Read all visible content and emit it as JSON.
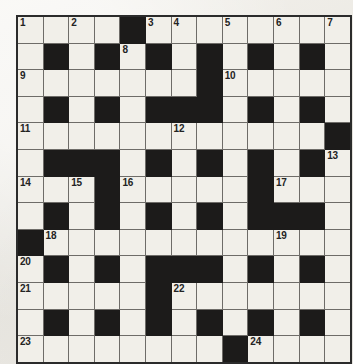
{
  "puzzle": {
    "type": "crossword-grid",
    "title": "Crossword Puzzle Grid",
    "rows": 13,
    "columns": 13,
    "cell_size_px": 24.6,
    "colors": {
      "paper": "#eeece7",
      "cell_fill": "#f1efe9",
      "block_fill": "#1c1b1a",
      "grid_line": "#6e6c68",
      "outer_border": "#2b2b2b",
      "number_text": "#232323"
    },
    "legend": {
      "block": "black / blocked square",
      "open": "white / fillable square"
    },
    "clue_count": 24,
    "clue_numbers_present": [
      1,
      2,
      3,
      4,
      5,
      6,
      7,
      8,
      9,
      10,
      11,
      12,
      13,
      14,
      15,
      16,
      17,
      18,
      19,
      20,
      21,
      22,
      23,
      24
    ],
    "grid": [
      [
        {
          "block": false,
          "number": "1"
        },
        {
          "block": false,
          "number": ""
        },
        {
          "block": false,
          "number": "2"
        },
        {
          "block": false,
          "number": ""
        },
        {
          "block": true,
          "number": ""
        },
        {
          "block": false,
          "number": "3"
        },
        {
          "block": false,
          "number": "4"
        },
        {
          "block": false,
          "number": ""
        },
        {
          "block": false,
          "number": "5"
        },
        {
          "block": false,
          "number": ""
        },
        {
          "block": false,
          "number": "6"
        },
        {
          "block": false,
          "number": ""
        },
        {
          "block": false,
          "number": "7"
        }
      ],
      [
        {
          "block": false,
          "number": ""
        },
        {
          "block": true,
          "number": ""
        },
        {
          "block": false,
          "number": ""
        },
        {
          "block": true,
          "number": ""
        },
        {
          "block": false,
          "number": "8"
        },
        {
          "block": true,
          "number": ""
        },
        {
          "block": false,
          "number": ""
        },
        {
          "block": true,
          "number": ""
        },
        {
          "block": false,
          "number": ""
        },
        {
          "block": true,
          "number": ""
        },
        {
          "block": false,
          "number": ""
        },
        {
          "block": true,
          "number": ""
        },
        {
          "block": false,
          "number": ""
        }
      ],
      [
        {
          "block": false,
          "number": "9"
        },
        {
          "block": false,
          "number": ""
        },
        {
          "block": false,
          "number": ""
        },
        {
          "block": false,
          "number": ""
        },
        {
          "block": false,
          "number": ""
        },
        {
          "block": false,
          "number": ""
        },
        {
          "block": false,
          "number": ""
        },
        {
          "block": true,
          "number": ""
        },
        {
          "block": false,
          "number": "10"
        },
        {
          "block": false,
          "number": ""
        },
        {
          "block": false,
          "number": ""
        },
        {
          "block": false,
          "number": ""
        },
        {
          "block": false,
          "number": ""
        }
      ],
      [
        {
          "block": false,
          "number": ""
        },
        {
          "block": true,
          "number": ""
        },
        {
          "block": false,
          "number": ""
        },
        {
          "block": true,
          "number": ""
        },
        {
          "block": false,
          "number": ""
        },
        {
          "block": true,
          "number": ""
        },
        {
          "block": true,
          "number": ""
        },
        {
          "block": true,
          "number": ""
        },
        {
          "block": false,
          "number": ""
        },
        {
          "block": true,
          "number": ""
        },
        {
          "block": false,
          "number": ""
        },
        {
          "block": true,
          "number": ""
        },
        {
          "block": false,
          "number": ""
        }
      ],
      [
        {
          "block": false,
          "number": "11"
        },
        {
          "block": false,
          "number": ""
        },
        {
          "block": false,
          "number": ""
        },
        {
          "block": false,
          "number": ""
        },
        {
          "block": false,
          "number": ""
        },
        {
          "block": false,
          "number": ""
        },
        {
          "block": false,
          "number": "12"
        },
        {
          "block": false,
          "number": ""
        },
        {
          "block": false,
          "number": ""
        },
        {
          "block": false,
          "number": ""
        },
        {
          "block": false,
          "number": ""
        },
        {
          "block": false,
          "number": ""
        },
        {
          "block": true,
          "number": ""
        }
      ],
      [
        {
          "block": false,
          "number": ""
        },
        {
          "block": true,
          "number": ""
        },
        {
          "block": true,
          "number": ""
        },
        {
          "block": true,
          "number": ""
        },
        {
          "block": false,
          "number": ""
        },
        {
          "block": true,
          "number": ""
        },
        {
          "block": false,
          "number": ""
        },
        {
          "block": true,
          "number": ""
        },
        {
          "block": false,
          "number": ""
        },
        {
          "block": true,
          "number": ""
        },
        {
          "block": false,
          "number": ""
        },
        {
          "block": true,
          "number": ""
        },
        {
          "block": false,
          "number": "13"
        }
      ],
      [
        {
          "block": false,
          "number": "14"
        },
        {
          "block": false,
          "number": ""
        },
        {
          "block": false,
          "number": "15"
        },
        {
          "block": true,
          "number": ""
        },
        {
          "block": false,
          "number": "16"
        },
        {
          "block": false,
          "number": ""
        },
        {
          "block": false,
          "number": ""
        },
        {
          "block": false,
          "number": ""
        },
        {
          "block": false,
          "number": ""
        },
        {
          "block": true,
          "number": ""
        },
        {
          "block": false,
          "number": "17"
        },
        {
          "block": false,
          "number": ""
        },
        {
          "block": false,
          "number": ""
        }
      ],
      [
        {
          "block": false,
          "number": ""
        },
        {
          "block": true,
          "number": ""
        },
        {
          "block": false,
          "number": ""
        },
        {
          "block": true,
          "number": ""
        },
        {
          "block": false,
          "number": ""
        },
        {
          "block": true,
          "number": ""
        },
        {
          "block": false,
          "number": ""
        },
        {
          "block": true,
          "number": ""
        },
        {
          "block": false,
          "number": ""
        },
        {
          "block": true,
          "number": ""
        },
        {
          "block": true,
          "number": ""
        },
        {
          "block": true,
          "number": ""
        },
        {
          "block": false,
          "number": ""
        }
      ],
      [
        {
          "block": true,
          "number": ""
        },
        {
          "block": false,
          "number": "18"
        },
        {
          "block": false,
          "number": ""
        },
        {
          "block": false,
          "number": ""
        },
        {
          "block": false,
          "number": ""
        },
        {
          "block": false,
          "number": ""
        },
        {
          "block": false,
          "number": ""
        },
        {
          "block": false,
          "number": ""
        },
        {
          "block": false,
          "number": ""
        },
        {
          "block": false,
          "number": ""
        },
        {
          "block": false,
          "number": "19"
        },
        {
          "block": false,
          "number": ""
        },
        {
          "block": false,
          "number": ""
        }
      ],
      [
        {
          "block": false,
          "number": "20"
        },
        {
          "block": true,
          "number": ""
        },
        {
          "block": false,
          "number": ""
        },
        {
          "block": true,
          "number": ""
        },
        {
          "block": false,
          "number": ""
        },
        {
          "block": true,
          "number": ""
        },
        {
          "block": true,
          "number": ""
        },
        {
          "block": true,
          "number": ""
        },
        {
          "block": false,
          "number": ""
        },
        {
          "block": true,
          "number": ""
        },
        {
          "block": false,
          "number": ""
        },
        {
          "block": true,
          "number": ""
        },
        {
          "block": false,
          "number": ""
        }
      ],
      [
        {
          "block": false,
          "number": "21"
        },
        {
          "block": false,
          "number": ""
        },
        {
          "block": false,
          "number": ""
        },
        {
          "block": false,
          "number": ""
        },
        {
          "block": false,
          "number": ""
        },
        {
          "block": true,
          "number": ""
        },
        {
          "block": false,
          "number": "22"
        },
        {
          "block": false,
          "number": ""
        },
        {
          "block": false,
          "number": ""
        },
        {
          "block": false,
          "number": ""
        },
        {
          "block": false,
          "number": ""
        },
        {
          "block": false,
          "number": ""
        },
        {
          "block": false,
          "number": ""
        }
      ],
      [
        {
          "block": false,
          "number": ""
        },
        {
          "block": true,
          "number": ""
        },
        {
          "block": false,
          "number": ""
        },
        {
          "block": true,
          "number": ""
        },
        {
          "block": false,
          "number": ""
        },
        {
          "block": true,
          "number": ""
        },
        {
          "block": false,
          "number": ""
        },
        {
          "block": true,
          "number": ""
        },
        {
          "block": false,
          "number": ""
        },
        {
          "block": true,
          "number": ""
        },
        {
          "block": false,
          "number": ""
        },
        {
          "block": true,
          "number": ""
        },
        {
          "block": false,
          "number": ""
        }
      ],
      [
        {
          "block": false,
          "number": "23"
        },
        {
          "block": false,
          "number": ""
        },
        {
          "block": false,
          "number": ""
        },
        {
          "block": false,
          "number": ""
        },
        {
          "block": false,
          "number": ""
        },
        {
          "block": false,
          "number": ""
        },
        {
          "block": false,
          "number": ""
        },
        {
          "block": false,
          "number": ""
        },
        {
          "block": true,
          "number": ""
        },
        {
          "block": false,
          "number": "24"
        },
        {
          "block": false,
          "number": ""
        },
        {
          "block": false,
          "number": ""
        },
        {
          "block": false,
          "number": ""
        }
      ]
    ]
  }
}
